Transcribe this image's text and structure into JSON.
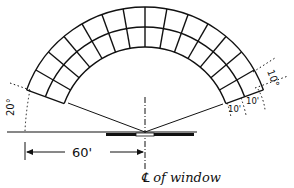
{
  "diagram": {
    "arc": {
      "start_angle_deg": 20,
      "end_angle_deg": 160,
      "angular_step_deg": 10,
      "ring_count": 2,
      "segment_count": 14
    },
    "labels": {
      "angle_left": "20°",
      "angle_right": "10°",
      "ring_width_1": "10'",
      "ring_width_2": "10'",
      "distance": "60'",
      "centerline": "℄ of window"
    },
    "colors": {
      "ink": "#111111",
      "background": "#ffffff"
    }
  }
}
